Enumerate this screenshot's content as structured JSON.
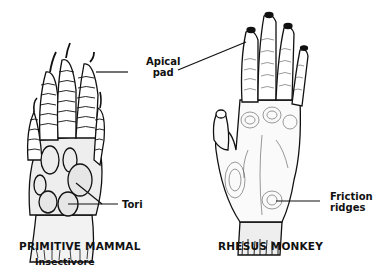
{
  "figure": {
    "left_specimen": {
      "title": "PRIMITIVE MAMMAL",
      "subtitle": "Insectivore"
    },
    "right_specimen": {
      "title": "RHESUS MONKEY"
    },
    "labels": {
      "apical_pad": [
        "Apical",
        "pad"
      ],
      "tori": "Tori",
      "friction_ridges": [
        "Friction",
        "ridges"
      ]
    },
    "colors": {
      "ink": "#111111",
      "background": "#ffffff",
      "shade": "#d8d8d8"
    }
  }
}
